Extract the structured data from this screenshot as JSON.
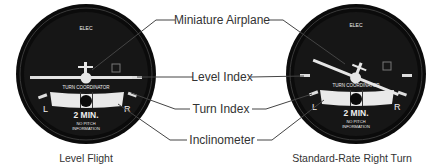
{
  "callouts": {
    "miniature_airplane": "Miniature Airplane",
    "level_index": "Level Index",
    "turn_index": "Turn Index",
    "inclinometer": "Inclinometer"
  },
  "gauges": [
    {
      "caption": "Level Flight",
      "elec": "ELEC",
      "title": "TURN COORDINATOR",
      "left": "L",
      "right": "R",
      "time": "2 MIN.",
      "note1": "NO PITCH",
      "note2": "INFORMATION",
      "bank_deg": 0
    },
    {
      "caption": "Standard-Rate Right Turn",
      "elec": "ELEC",
      "title": "TURN COORDINATOR",
      "left": "L",
      "right": "R",
      "time": "2 MIN.",
      "note1": "NO PITCH",
      "note2": "INFORMATION",
      "bank_deg": 20
    }
  ],
  "colors": {
    "bezel": "#0d0d0d",
    "face": "#151515",
    "marking": "#e8e8e8",
    "line": "#444444"
  }
}
